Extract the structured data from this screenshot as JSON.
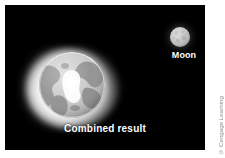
{
  "figure": {
    "background_color": "#ffffff",
    "panel_color": "#000000",
    "label_color": "#ffffff",
    "credit_color": "#8c8c8c"
  },
  "sky": {
    "name": "space-background"
  },
  "earth": {
    "name": "earth-globe",
    "caption": "Combined result",
    "body_color": "#c9c9c9",
    "land_color": "#909090",
    "highlight_color": "#ffffff",
    "halo_color": "#ffffff"
  },
  "moon": {
    "name": "moon-body",
    "label": "Moon",
    "body_color": "#c4c4c4",
    "crater_color": "#a5a5a5"
  },
  "credit": {
    "text": "© Cengage Learning"
  }
}
